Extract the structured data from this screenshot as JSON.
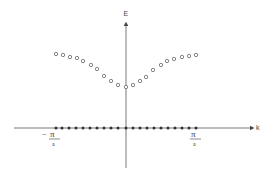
{
  "chart_data": {
    "type": "scatter",
    "title": "",
    "xlabel": "k",
    "ylabel": "E",
    "tick_labels": {
      "left": {
        "numerator": "π",
        "denominator": "a",
        "sign": "−"
      },
      "right": {
        "numerator": "π",
        "denominator": "a",
        "sign": ""
      }
    },
    "series": [
      {
        "name": "upper-band",
        "marker": "open-circle",
        "points_px": [
          [
            56,
            54
          ],
          [
            63,
            55
          ],
          [
            70,
            57
          ],
          [
            77,
            58
          ],
          [
            83,
            61
          ],
          [
            91,
            65
          ],
          [
            97,
            69
          ],
          [
            104,
            76
          ],
          [
            111,
            81
          ],
          [
            118,
            85
          ],
          [
            126,
            87
          ],
          [
            133,
            85
          ],
          [
            140,
            81
          ],
          [
            146,
            77
          ],
          [
            153,
            70
          ],
          [
            161,
            65
          ],
          [
            167,
            61
          ],
          [
            174,
            59
          ],
          [
            182,
            57
          ],
          [
            189,
            56
          ],
          [
            196,
            55
          ]
        ]
      },
      {
        "name": "lower-band",
        "marker": "filled-circle",
        "points_px": [
          [
            56,
            128
          ],
          [
            62,
            128
          ],
          [
            69,
            128
          ],
          [
            76,
            128
          ],
          [
            83,
            128
          ],
          [
            90,
            128
          ],
          [
            97,
            128
          ],
          [
            104,
            128
          ],
          [
            111,
            128
          ],
          [
            118,
            128
          ],
          [
            126,
            128
          ],
          [
            133,
            128
          ],
          [
            140,
            128
          ],
          [
            147,
            128
          ],
          [
            154,
            128
          ],
          [
            161,
            128
          ],
          [
            168,
            128
          ],
          [
            175,
            128
          ],
          [
            182,
            128
          ],
          [
            189,
            128
          ],
          [
            196,
            128
          ]
        ]
      }
    ],
    "axes": {
      "origin_px": [
        126,
        128
      ],
      "x_axis_px": [
        14,
        252
      ],
      "y_axis_px": [
        22,
        168
      ],
      "brillouin_zone_px": [
        56,
        196
      ]
    },
    "grid": false,
    "legend": null
  },
  "labels": {
    "e_axis": "E",
    "k_axis": "k",
    "pi_symbol": "π",
    "a_symbol": "a",
    "minus_sign": "−"
  },
  "colors": {
    "axis": "#555555",
    "open_marker": "#666666",
    "filled_marker": "#333333"
  }
}
